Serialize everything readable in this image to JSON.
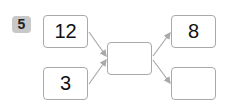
{
  "problem": {
    "number": "5",
    "inputs": [
      "12",
      "3"
    ],
    "middle": "",
    "outputs": [
      "8",
      ""
    ]
  },
  "colors": {
    "badge_bg": "#c8c8c8",
    "box_border": "#a9a9a9",
    "arrow": "#a9a9a9"
  }
}
